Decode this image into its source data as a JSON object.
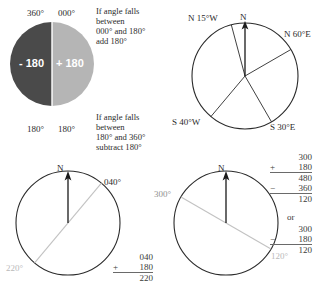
{
  "figure": {
    "title_hidden": "Bearings and back-bearings",
    "panels": [
      {
        "id": "half-circle-rule",
        "top_left_label": "360°",
        "top_right_label": "000°",
        "bottom_left_label": "180°",
        "bottom_right_label": "180°",
        "left_half_text": "- 180",
        "right_half_text": "+ 180",
        "left_half_color": "#4a4a4a",
        "right_half_color": "#b5b5b5",
        "note_top": "If angle falls\nbetween\n000° and 180°\nadd 180°",
        "note_bottom": "If angle falls\nbetween\n180° and 360°\nsubtract 180°"
      },
      {
        "id": "quadrant-bearings",
        "north_label": "N",
        "bearings": [
          {
            "label": "N 15°W",
            "angle_deg": 345
          },
          {
            "label": "N 60°E",
            "angle_deg": 60
          },
          {
            "label": "S 30°E",
            "angle_deg": 150
          },
          {
            "label": "S 40°W",
            "angle_deg": 220
          }
        ]
      },
      {
        "id": "bearing-040",
        "north_label": "N",
        "bearing_label": "040°",
        "back_bearing_label": "220°",
        "bearing_deg": 40,
        "back_bearing_deg": 220,
        "calc": {
          "line1": "040",
          "op": "+",
          "line2": "180",
          "result": "220"
        }
      },
      {
        "id": "bearing-300",
        "north_label": "N",
        "bearing_label": "300°",
        "back_bearing_label": "120°",
        "bearing_deg": 300,
        "back_bearing_deg": 120,
        "calc_a": {
          "line1": "300",
          "op1": "+",
          "line2": "180",
          "sub1": "480",
          "op2": "−",
          "line3": "360",
          "result": "120"
        },
        "connector": "or",
        "calc_b": {
          "line1": "300",
          "op": "−",
          "line2": "180",
          "result": "120"
        }
      }
    ]
  },
  "colors": {
    "ink": "#1a1a1a",
    "gray_line": "#b9b9b9",
    "dark_half": "#4a4a4a",
    "light_half": "#b5b5b5"
  }
}
